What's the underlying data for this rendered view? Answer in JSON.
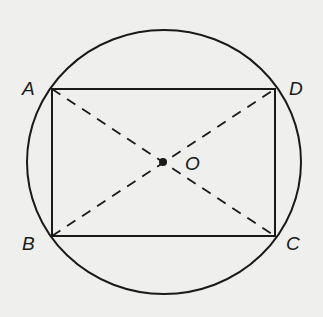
{
  "diagram": {
    "points": {
      "A": {
        "label": "A",
        "x": 52,
        "y": 89
      },
      "B": {
        "label": "B",
        "x": 52,
        "y": 236
      },
      "C": {
        "label": "C",
        "x": 275,
        "y": 236
      },
      "D": {
        "label": "D",
        "x": 275,
        "y": 89
      },
      "O": {
        "label": "O",
        "x": 163,
        "y": 162
      }
    },
    "circle": {
      "cx": 164,
      "cy": 162,
      "rx": 137,
      "ry": 132
    },
    "segments": [
      "AB",
      "BC",
      "CD",
      "DA"
    ],
    "dashed_segments": [
      "AC",
      "BD"
    ],
    "colors": {
      "stroke": "#1a1a1a",
      "background": "#efefed"
    }
  }
}
